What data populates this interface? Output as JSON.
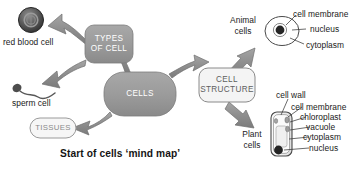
{
  "figure": {
    "caption": "Start of cells ‘mind map’",
    "palette": {
      "arrow_fill": "#8d8d8d",
      "arrow_stroke": "#6f6f6f",
      "node_fill": "#9a9a9a",
      "node_fill_light": "#f2f2f2",
      "node_stroke": "#7c7c7c",
      "node_text_light": "#ffffff",
      "node_text_dark": "#5e5e5e",
      "label_text": "#1a1a1a",
      "leader_line": "#3a3a3a",
      "cell_body": "#ffffff",
      "nucleus": "#2b2b2b",
      "background": "#ffffff"
    }
  },
  "nodes": {
    "types_of_cell": {
      "line1": "TYPES",
      "line2": "OF CELL"
    },
    "cells": {
      "label": "CELLS"
    },
    "cell_structure": {
      "line1": "CELL",
      "line2": "STRUCTURE"
    },
    "tissues": {
      "label": "TISSUES"
    }
  },
  "specimens": {
    "red_blood_cell": {
      "label": "red blood cell"
    },
    "sperm_cell": {
      "label": "sperm cell"
    },
    "animal_cells": {
      "label_line1": "Animal",
      "label_line2": "cells",
      "parts": [
        {
          "name": "cell membrane"
        },
        {
          "name": "nucleus"
        },
        {
          "name": "cytoplasm"
        }
      ]
    },
    "plant_cells": {
      "label_line1": "Plant",
      "label_line2": "cells",
      "parts": [
        {
          "name": "cell wall"
        },
        {
          "name": "cell membrane"
        },
        {
          "name": "chloroplast"
        },
        {
          "name": "vacuole"
        },
        {
          "name": "cytoplasm"
        },
        {
          "name": "nucleus"
        }
      ]
    }
  }
}
